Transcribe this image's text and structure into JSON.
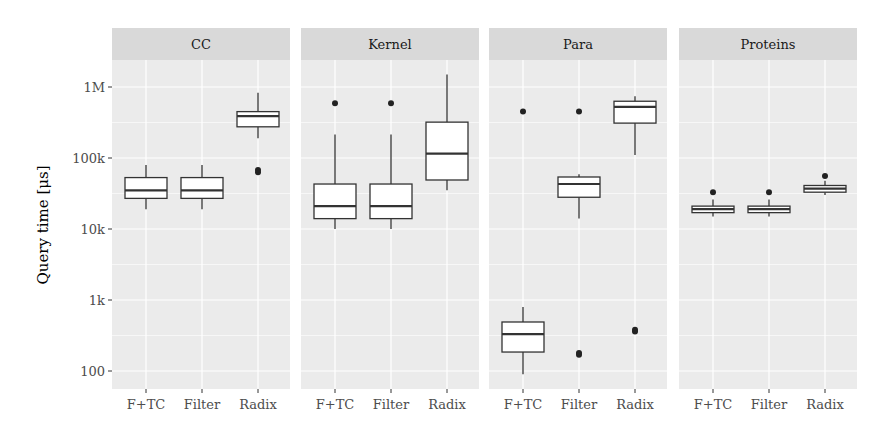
{
  "chart_data": {
    "type": "boxplot",
    "title": "",
    "xlabel": "",
    "ylabel": "Query time [μs]",
    "yscale": "log10",
    "ylim": [
      60,
      2000000
    ],
    "y_ticks": [
      {
        "value": 100,
        "label": "100"
      },
      {
        "value": 1000,
        "label": "1k"
      },
      {
        "value": 10000,
        "label": "10k"
      },
      {
        "value": 100000,
        "label": "100k"
      },
      {
        "value": 1000000,
        "label": "1M"
      }
    ],
    "categories": [
      "F+TC",
      "Filter",
      "Radix"
    ],
    "grid": true,
    "legend": null,
    "panels": [
      {
        "name": "CC",
        "boxes": [
          {
            "category": "F+TC",
            "whisker_low": 19000,
            "q1": 27000,
            "median": 35000,
            "q3": 53000,
            "whisker_high": 80000,
            "outliers": []
          },
          {
            "category": "Filter",
            "whisker_low": 19000,
            "q1": 27000,
            "median": 35000,
            "q3": 53000,
            "whisker_high": 80000,
            "outliers": []
          },
          {
            "category": "Radix",
            "whisker_low": 190000,
            "q1": 275000,
            "median": 390000,
            "q3": 450000,
            "whisker_high": 830000,
            "outliers": [
              63000,
              68000
            ]
          }
        ]
      },
      {
        "name": "Kernel",
        "boxes": [
          {
            "category": "F+TC",
            "whisker_low": 10000,
            "q1": 14000,
            "median": 21000,
            "q3": 43000,
            "whisker_high": 215000,
            "outliers": [
              590000
            ]
          },
          {
            "category": "Filter",
            "whisker_low": 10000,
            "q1": 14000,
            "median": 21000,
            "q3": 43000,
            "whisker_high": 215000,
            "outliers": [
              590000
            ]
          },
          {
            "category": "Radix",
            "whisker_low": 35000,
            "q1": 49000,
            "median": 115000,
            "q3": 320000,
            "whisker_high": 1500000,
            "outliers": []
          }
        ]
      },
      {
        "name": "Para",
        "boxes": [
          {
            "category": "F+TC",
            "whisker_low": 90,
            "q1": 185,
            "median": 330,
            "q3": 490,
            "whisker_high": 800,
            "outliers": [
              450000
            ]
          },
          {
            "category": "Filter",
            "whisker_low": 14000,
            "q1": 28000,
            "median": 43000,
            "q3": 54000,
            "whisker_high": 59000,
            "outliers": [
              450000,
              170,
              180
            ]
          },
          {
            "category": "Radix",
            "whisker_low": 110000,
            "q1": 310000,
            "median": 525000,
            "q3": 630000,
            "whisker_high": 740000,
            "outliers": [
              360,
              380
            ]
          }
        ]
      },
      {
        "name": "Proteins",
        "boxes": [
          {
            "category": "F+TC",
            "whisker_low": 15000,
            "q1": 17000,
            "median": 19000,
            "q3": 21000,
            "whisker_high": 26000,
            "outliers": [
              33000
            ]
          },
          {
            "category": "Filter",
            "whisker_low": 15000,
            "q1": 17000,
            "median": 19000,
            "q3": 21000,
            "whisker_high": 26000,
            "outliers": [
              33000
            ]
          },
          {
            "category": "Radix",
            "whisker_low": 30000,
            "q1": 33000,
            "median": 37000,
            "q3": 41000,
            "whisker_high": 48000,
            "outliers": [
              56000
            ]
          }
        ]
      }
    ]
  },
  "layout": {
    "panel_bg": "#ebebeb",
    "strip_bg": "#d9d9d9",
    "grid_color": "#ffffff",
    "box_fill": "#ffffff",
    "box_stroke": "#333333"
  }
}
